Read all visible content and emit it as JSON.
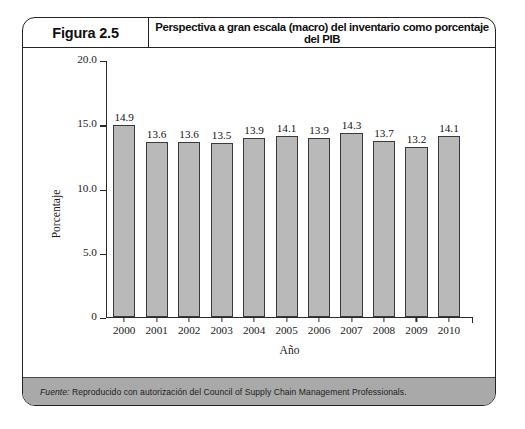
{
  "figure": {
    "number_label": "Figura 2.5",
    "title": "Perspectiva a gran escala (macro) del inventario como porcentaje del PIB",
    "source_label": "Fuente:",
    "source_text": " Reproducido con autorización del Council of Supply Chain Management Professionals."
  },
  "chart_data": {
    "type": "bar",
    "title": "Perspectiva a gran escala (macro) del inventario como porcentaje del PIB",
    "xlabel": "Año",
    "ylabel": "Porcentaje",
    "categories": [
      "2000",
      "2001",
      "2002",
      "2003",
      "2004",
      "2005",
      "2006",
      "2007",
      "2008",
      "2009",
      "2010"
    ],
    "values": [
      14.9,
      13.6,
      13.6,
      13.5,
      13.9,
      14.1,
      13.9,
      14.3,
      13.7,
      13.2,
      14.1
    ],
    "value_labels": [
      "14.9",
      "13.6",
      "13.6",
      "13.5",
      "13.9",
      "14.1",
      "13.9",
      "14.3",
      "13.7",
      "13.2",
      "14.1"
    ],
    "ylim": [
      0,
      20
    ],
    "yticks": [
      0,
      5,
      10,
      15,
      20
    ],
    "ytick_labels": [
      "0",
      "5.0",
      "10.0",
      "15.0",
      "20.0"
    ],
    "grid": false,
    "legend": false,
    "bar_color": "#b9b9b9",
    "bar_edge_color": "#3a3a3a"
  }
}
